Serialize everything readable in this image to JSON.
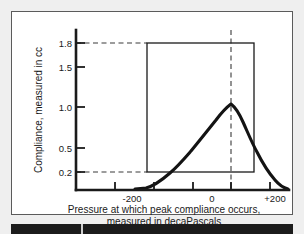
{
  "figure": {
    "background_color": "#ffffff",
    "border_color": "#5b5b5b",
    "page_background": "#efefef"
  },
  "chart_data": {
    "type": "line",
    "title": "",
    "xlabel_line1": "Pressure at which peak compliance occurs,",
    "xlabel_line2": "measured in decaPascals",
    "ylabel": "Compliance, measured in cc",
    "xlim": [
      -300,
      250
    ],
    "ylim": [
      0,
      2.0
    ],
    "grid": false,
    "legend": null,
    "x_ticks": [
      -300,
      -200,
      -100,
      0,
      100,
      200
    ],
    "x_tick_labels": [
      "",
      "-200",
      "",
      "0",
      "",
      "+200"
    ],
    "y_ticks": [
      0.2,
      0.5,
      1.0,
      1.5,
      1.8
    ],
    "y_tick_labels": [
      "0.2",
      "0.5",
      "1.0",
      "1.5",
      "1.8"
    ],
    "series": [
      {
        "name": "tympanogram",
        "peak_x": 0,
        "peak_y": 0.88,
        "x": [
          -300,
          -260,
          -220,
          -190,
          -165,
          -145,
          -125,
          -105,
          -85,
          -65,
          -48,
          -32,
          -18,
          -8,
          0,
          8,
          18,
          30,
          45,
          62,
          82,
          105,
          130,
          158,
          188,
          215,
          240
        ],
        "y": [
          0.0,
          0.0,
          0.0,
          0.01,
          0.03,
          0.07,
          0.12,
          0.18,
          0.25,
          0.33,
          0.42,
          0.52,
          0.66,
          0.79,
          0.88,
          0.78,
          0.64,
          0.51,
          0.4,
          0.32,
          0.25,
          0.19,
          0.13,
          0.08,
          0.03,
          0.01,
          0.0
        ]
      }
    ],
    "annotations": {
      "normal_box": {
        "label": "normal range box",
        "x_min": -140,
        "x_max": 50,
        "y_min": 0.2,
        "y_max": 1.8
      },
      "guide_line_upper": {
        "label": "dashed guide at 1.8 cc",
        "y": 1.8,
        "from_x": -300,
        "to_x": -140
      },
      "guide_line_lower": {
        "label": "dashed guide at 0.2 cc",
        "y": 0.2,
        "from_x": -300,
        "to_x": -140
      },
      "guide_line_center": {
        "label": "dashed vertical guide at 0 daPa",
        "x": 0,
        "from_y": 0.0,
        "to_y": 2.0
      }
    }
  }
}
